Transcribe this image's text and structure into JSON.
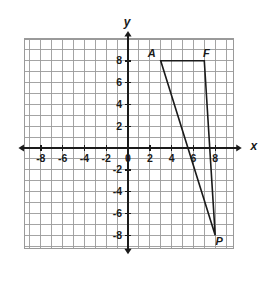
{
  "figure": {
    "background_color": "#ffffff"
  },
  "chart_data": {
    "type": "scatter",
    "title": "",
    "xlabel": "x",
    "ylabel": "y",
    "xlim": [
      -10,
      10
    ],
    "ylim": [
      -10,
      10
    ],
    "grid": true,
    "grid_step": 1,
    "legend": "none",
    "axis_color": "#1a1a1a",
    "grid_color": "#9a9a9a",
    "shape_color": "#1a1a1a",
    "x_tick_labels": [
      "-8",
      "-6",
      "-4",
      "-2",
      "0",
      "2",
      "4",
      "6",
      "8"
    ],
    "x_tick_values": [
      -8,
      -6,
      -4,
      -2,
      0,
      2,
      4,
      6,
      8
    ],
    "y_tick_labels": [
      "8",
      "6",
      "4",
      "2",
      "-2",
      "-4",
      "-6",
      "-8"
    ],
    "y_tick_values": [
      8,
      6,
      4,
      2,
      -2,
      -4,
      -6,
      -8
    ],
    "origin_label": "0",
    "shapes": [
      {
        "name": "triangle-AFP",
        "type": "polygon",
        "closed": true,
        "vertices": [
          {
            "label": "A",
            "x": 3,
            "y": 8
          },
          {
            "label": "F",
            "x": 7,
            "y": 8
          },
          {
            "label": "P",
            "x": 8,
            "y": -8
          }
        ]
      }
    ],
    "vertex_labels": [
      {
        "label": "A",
        "x": 3,
        "y": 8,
        "offset_x": -9,
        "offset_y": -4
      },
      {
        "label": "F",
        "x": 7,
        "y": 8,
        "offset_x": 2,
        "offset_y": -4
      },
      {
        "label": "P",
        "x": 8,
        "y": -8,
        "offset_x": 4,
        "offset_y": 10
      }
    ]
  }
}
